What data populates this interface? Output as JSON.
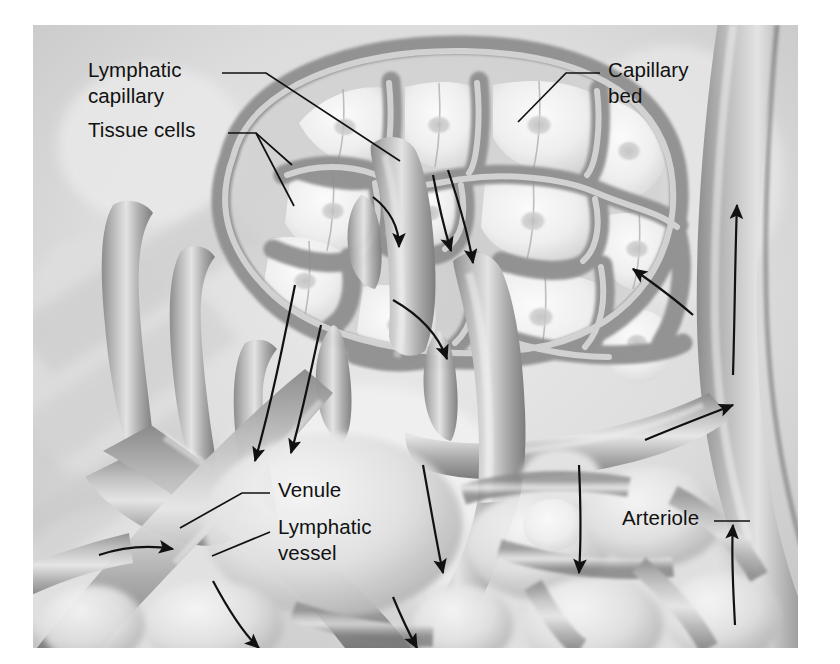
{
  "figure": {
    "type": "anatomical-illustration",
    "style": "grayscale airbrush rendering",
    "background_color": "#d8d8d8",
    "ink_color": "#111111",
    "plate": {
      "x": 33,
      "y": 25,
      "width": 765,
      "height": 623
    }
  },
  "labels": [
    {
      "id": "lymphatic-capillary",
      "line1": "Lymphatic",
      "line2": "capillary",
      "x": 88,
      "y": 58,
      "leader": "elbow-right-down"
    },
    {
      "id": "tissue-cells",
      "line1": "Tissue cells",
      "line2": "",
      "x": 88,
      "y": 118,
      "leader": "fork-two-right-down"
    },
    {
      "id": "capillary-bed",
      "line1": "Capillary",
      "line2": "bed",
      "x": 608,
      "y": 58,
      "leader": "elbow-left-down"
    },
    {
      "id": "venule",
      "line1": "Venule",
      "line2": "",
      "x": 278,
      "y": 478,
      "leader": "elbow-left-down"
    },
    {
      "id": "lymphatic-vessel",
      "line1": "Lymphatic",
      "line2": "vessel",
      "x": 278,
      "y": 515,
      "leader": "stem-down-left"
    },
    {
      "id": "arteriole",
      "line1": "Arteriole",
      "line2": "",
      "x": 622,
      "y": 506,
      "leader": "dash-right"
    }
  ],
  "flow_arrows": [
    {
      "id": "arrow-lymph-upper-left",
      "note": "downward into lymphatic vessel, left tissue"
    },
    {
      "id": "arrow-lymph-center-upper",
      "note": "curving down into lymphatic capillary"
    },
    {
      "id": "arrow-lymph-center-mid",
      "note": "down the central lymphatic capillary"
    },
    {
      "id": "arrow-lymph-center-lower",
      "note": "down toward lymphatic vessel"
    },
    {
      "id": "arrow-capillary-bed-right",
      "note": "blood entering capillary bed, up-left"
    },
    {
      "id": "arrow-arteriole-up-right",
      "note": "arteriole flow upward"
    },
    {
      "id": "arrow-arteriole-lower",
      "note": "arteriole flow upward, lower branch"
    },
    {
      "id": "arrow-venule-out-left",
      "note": "venule flow down-left, out of frame"
    },
    {
      "id": "arrow-venule-lower-left",
      "note": "venule flow to the left"
    },
    {
      "id": "arrow-to-venule-right",
      "note": "flow into venule from the right"
    },
    {
      "id": "arrow-bottom-center",
      "note": "lymph flowing downward bottom center"
    },
    {
      "id": "arrow-bottom-left",
      "note": "flow down-left at bottom"
    },
    {
      "id": "arrow-bottom-right-mid",
      "note": "downward flow right of center"
    },
    {
      "id": "arrow-bottom-far-left",
      "note": "flow to the left at lower left"
    }
  ],
  "structures": {
    "capillary_bed_cells": 26,
    "lymphatic_blind_ends": 7,
    "vessels": [
      "arteriole",
      "venule",
      "lymphatic vessel",
      "lymphatic capillary",
      "capillary bed"
    ]
  }
}
